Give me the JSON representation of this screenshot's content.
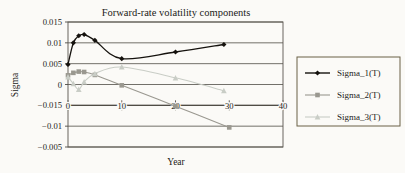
{
  "chart_data": {
    "type": "line",
    "title": "Forward-rate volatility components",
    "xlabel": "Year",
    "ylabel": "Sigma",
    "grid": true,
    "legend_position": "right",
    "xlim": [
      0,
      40
    ],
    "xticks": [
      "0",
      "10",
      "20",
      "30",
      "40"
    ],
    "xtick_values": [
      0,
      10,
      20,
      30,
      40
    ],
    "yticks": [
      "0.015",
      "0.01",
      "0.005",
      "0",
      "-0.015",
      "-0.01",
      "-0.005"
    ],
    "ytick_values": [
      0.015,
      0.01,
      0.005,
      0,
      -0.005,
      -0.01,
      -0.015
    ],
    "series": [
      {
        "name": "Sigma_1(T)",
        "color": "#15120e",
        "marker": "diamond",
        "x": [
          0,
          1,
          2,
          3,
          5,
          10,
          20,
          29
        ],
        "values": [
          0.0048,
          0.01,
          0.0117,
          0.012,
          0.0106,
          0.0062,
          0.0078,
          0.0096
        ]
      },
      {
        "name": "Sigma_2(T)",
        "color": "#9a9890",
        "marker": "square",
        "x": [
          0,
          1,
          2,
          3,
          5,
          10,
          20,
          30
        ],
        "values": [
          0.0022,
          0.0028,
          0.0031,
          0.003,
          0.0023,
          -0.0002,
          -0.0052,
          -0.0103
        ]
      },
      {
        "name": "Sigma_3(T)",
        "color": "#c9cdc6",
        "marker": "triangle",
        "x": [
          0,
          1,
          2,
          3,
          5,
          10,
          20,
          29
        ],
        "values": [
          0.0018,
          0.0002,
          -0.0012,
          0.0006,
          0.0026,
          0.0042,
          0.0016,
          -0.0015
        ]
      }
    ]
  },
  "legend": {
    "items": [
      {
        "label": "Sigma_1(T)"
      },
      {
        "label": "Sigma_2(T)"
      },
      {
        "label": "Sigma_3(T)"
      }
    ]
  }
}
